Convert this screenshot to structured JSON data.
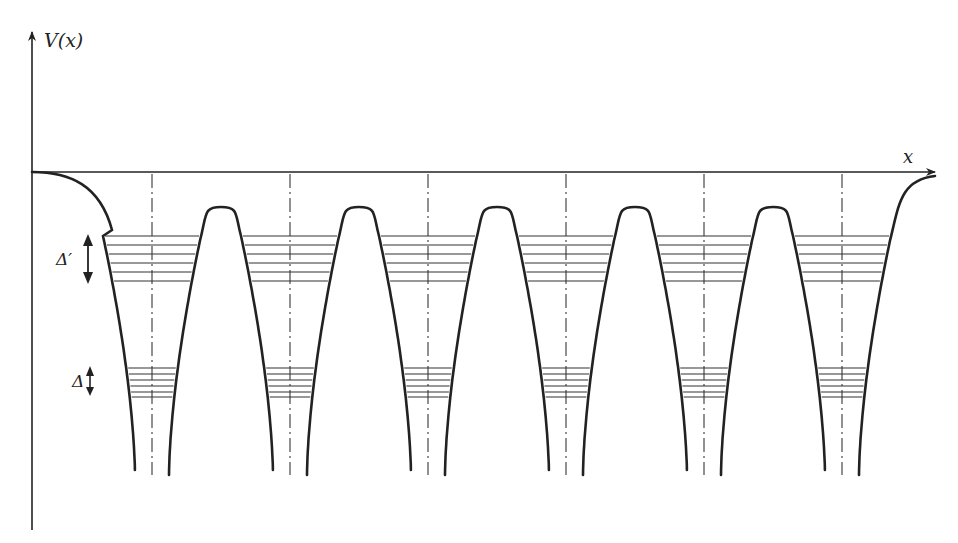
{
  "figure": {
    "y_axis_label": "V(x)",
    "x_axis_label": "x",
    "upper_band_label": "Δ′",
    "lower_band_label": "Δ",
    "colors": {
      "ink": "#222222",
      "background": "#ffffff"
    }
  },
  "geometry": {
    "origin_x": 32,
    "axis_y": 172,
    "x_arrow_tip": 937,
    "y_axis_top": 28,
    "y_axis_bottom": 530,
    "well_centers": [
      152,
      290,
      428,
      566,
      704,
      842
    ],
    "barrier_peaks": [
      221,
      359,
      497,
      635,
      773
    ],
    "peak_y": 207,
    "well_bottom_y": 475,
    "upper_band_levels": [
      236,
      245,
      254,
      263,
      272,
      281
    ],
    "lower_band_levels": [
      368,
      374,
      380,
      386,
      392,
      397
    ]
  }
}
